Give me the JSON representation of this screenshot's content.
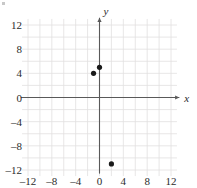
{
  "figure": {
    "name": "coordinate-plane-scatter",
    "background_color": "#ffffff",
    "grid_color": "#e2e0e0",
    "axis_color": "#595959",
    "point_color": "#1a1a1a",
    "label_color": "#2b2b2b",
    "x_axis_label": "x",
    "y_axis_label": "y",
    "x_tick_labels": [
      "–12",
      "–8",
      "–4",
      "0",
      "4",
      "8",
      "12"
    ],
    "y_tick_labels": [
      "12",
      "8",
      "4",
      "0",
      "–4",
      "–8",
      "–12"
    ]
  },
  "chart_data": {
    "type": "scatter",
    "title": "",
    "subtitle": "",
    "xlabel": "x",
    "ylabel": "y",
    "xlim": [
      -13,
      13
    ],
    "ylim": [
      -13,
      13
    ],
    "xticks": [
      -12,
      -8,
      -4,
      0,
      4,
      8,
      12
    ],
    "yticks": [
      -12,
      -8,
      -4,
      0,
      -4,
      8,
      12
    ],
    "xtick_labels": [
      "–12",
      "–8",
      "–4",
      "0",
      "4",
      "8",
      "12"
    ],
    "ytick_labels": [
      "12",
      "8",
      "4",
      "0",
      "–4",
      "–8",
      "–12"
    ],
    "grid": true,
    "grid_step": 2,
    "tick_label_step": 4,
    "legend": null,
    "legend_position": "none",
    "points": [
      {
        "x": -1,
        "y": 4
      },
      {
        "x": 0,
        "y": 5
      },
      {
        "x": 2,
        "y": -11
      }
    ],
    "series": [
      {
        "name": "plotted points",
        "x": [
          -1,
          0,
          2
        ],
        "y": [
          4,
          5,
          -11
        ]
      }
    ],
    "annotations": []
  }
}
